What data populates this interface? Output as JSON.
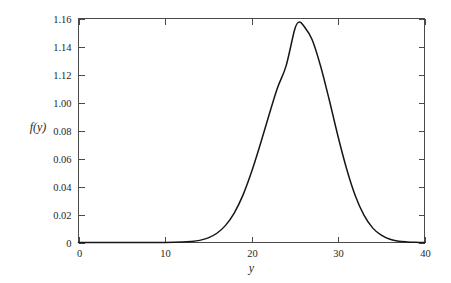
{
  "chart_data": {
    "type": "line",
    "title": "",
    "subtitle": "",
    "xlabel": "y",
    "ylabel": "f(y)",
    "xlim": [
      0,
      40
    ],
    "ylim": [
      0,
      1.16
    ],
    "grid": false,
    "legend": null,
    "x_tick_labels": [
      "0",
      "10",
      "20",
      "30",
      "40"
    ],
    "x_tick_values": [
      0,
      10,
      20,
      30,
      40
    ],
    "y_tick_labels": [
      "1.16",
      "1.14",
      "1.12",
      "1.00",
      "0.08",
      "0.06",
      "0.04",
      "0.02",
      "0"
    ],
    "y_tick_positions_fraction": [
      1.0,
      0.875,
      0.75,
      0.625,
      0.5,
      0.375,
      0.25,
      0.125,
      0.0
    ],
    "series": [
      {
        "name": "f(y)",
        "color": "#161616",
        "peak_x": 25.5,
        "peak_y": 1.145,
        "x": [
          0,
          2,
          4,
          6,
          8,
          10,
          12,
          13,
          14,
          15,
          16,
          17,
          18,
          19,
          20,
          21,
          22,
          23,
          24,
          25,
          25.5,
          26,
          27,
          28,
          29,
          30,
          31,
          32,
          33,
          34,
          35,
          36,
          37,
          38,
          39,
          40
        ],
        "values": [
          0,
          0,
          0,
          0,
          0,
          0,
          0.002,
          0.005,
          0.011,
          0.024,
          0.048,
          0.089,
          0.153,
          0.245,
          0.366,
          0.508,
          0.659,
          0.803,
          0.918,
          1.108,
          1.145,
          1.128,
          1.055,
          0.915,
          0.739,
          0.552,
          0.382,
          0.243,
          0.142,
          0.076,
          0.038,
          0.017,
          0.007,
          0.003,
          0.001,
          0
        ]
      }
    ],
    "annotations": []
  },
  "axes": {
    "y_label": "f(y)",
    "x_label": "y",
    "y_ticks": [
      "1.16",
      "1.14",
      "1.12",
      "1.00",
      "0.08",
      "0.06",
      "0.04",
      "0.02",
      "0"
    ],
    "x_ticks": [
      "0",
      "10",
      "20",
      "30",
      "40"
    ]
  },
  "colors": {
    "curve": "#161616",
    "frame": "#4a4a4a",
    "text": "#1f1f1f",
    "background": "#ffffff"
  }
}
